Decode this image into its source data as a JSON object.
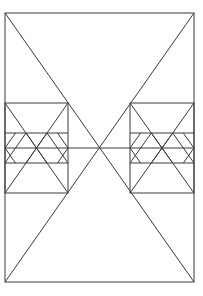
{
  "diagram": {
    "stroke_color": "#3a3a3a",
    "background_color": "#ffffff",
    "outer_rect": {
      "x1": 5,
      "y1": 13,
      "x2": 194,
      "y2": 282
    },
    "big_x": [
      {
        "x1": 5,
        "y1": 13,
        "x2": 194,
        "y2": 282
      },
      {
        "x1": 194,
        "y1": 13,
        "x2": 5,
        "y2": 282
      }
    ],
    "midline": {
      "x1": 5,
      "y1": 148,
      "x2": 194,
      "y2": 148
    },
    "left_box": {
      "x1": 5,
      "y1": 103,
      "x2": 68,
      "y2": 193,
      "band_top": 133,
      "band_bottom": 163
    },
    "right_box": {
      "x1": 130,
      "y1": 103,
      "x2": 194,
      "y2": 193,
      "band_top": 133,
      "band_bottom": 163
    }
  }
}
